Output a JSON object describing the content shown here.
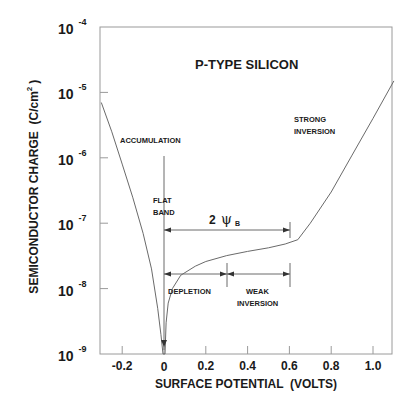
{
  "chart_data": {
    "type": "line",
    "title": "P-TYPE SILICON",
    "xlabel": "SURFACE POTENTIAL  (VOLTS)",
    "ylabel": "SEMICONDUCTOR CHARGE  (C/cm²)",
    "ylabel_text": "SEMICONDUCTOR CHARGE  (C/cm",
    "ylabel_sup": "2",
    "ylabel_close": ")",
    "xlim": [
      -0.3,
      1.1
    ],
    "ylim": [
      1e-09,
      0.0001
    ],
    "yscale": "log",
    "grid": false,
    "x_ticks": [
      {
        "value": -0.2,
        "label": "-0.2"
      },
      {
        "value": 0,
        "label": "0"
      },
      {
        "value": 0.2,
        "label": "0.2"
      },
      {
        "value": 0.4,
        "label": "0.4"
      },
      {
        "value": 0.6,
        "label": "0.6"
      },
      {
        "value": 0.8,
        "label": "0.8"
      },
      {
        "value": 1.0,
        "label": "1.0"
      }
    ],
    "y_ticks": [
      {
        "exp": -4,
        "base": "10",
        "sup": "-4"
      },
      {
        "exp": -5,
        "base": "10",
        "sup": "-5"
      },
      {
        "exp": -6,
        "base": "10",
        "sup": "-6"
      },
      {
        "exp": -7,
        "base": "10",
        "sup": "-7"
      },
      {
        "exp": -8,
        "base": "10",
        "sup": "-8"
      },
      {
        "exp": -9,
        "base": "10",
        "sup": "-9"
      }
    ],
    "series": [
      {
        "name": "|Qs| vs surface potential",
        "points": [
          [
            -0.3,
            7e-06
          ],
          [
            -0.25,
            2.5e-06
          ],
          [
            -0.2,
            8e-07
          ],
          [
            -0.15,
            2.5e-07
          ],
          [
            -0.1,
            7e-08
          ],
          [
            -0.06,
            2e-08
          ],
          [
            -0.03,
            5e-09
          ],
          [
            -0.015,
            2e-09
          ],
          [
            -0.005,
            1e-09
          ],
          [
            0.005,
            1e-09
          ],
          [
            0.01,
            3e-09
          ],
          [
            0.02,
            6e-09
          ],
          [
            0.04,
            1e-08
          ],
          [
            0.08,
            1.6e-08
          ],
          [
            0.15,
            2.2e-08
          ],
          [
            0.2,
            2.6e-08
          ],
          [
            0.3,
            3.2e-08
          ],
          [
            0.4,
            3.7e-08
          ],
          [
            0.5,
            4.2e-08
          ],
          [
            0.58,
            4.8e-08
          ],
          [
            0.64,
            5.6e-08
          ],
          [
            0.7,
            1e-07
          ],
          [
            0.8,
            3e-07
          ],
          [
            0.9,
            1.1e-06
          ],
          [
            1.0,
            4e-06
          ],
          [
            1.1,
            1.5e-05
          ]
        ]
      }
    ],
    "annotations": [
      {
        "id": "accumulation",
        "text": "ACCUMULATION"
      },
      {
        "id": "flat_band_1",
        "text": "FLAT"
      },
      {
        "id": "flat_band_2",
        "text": "BAND"
      },
      {
        "id": "two_psi_b_num",
        "text": "2"
      },
      {
        "id": "two_psi_b_sym",
        "text": "ψ"
      },
      {
        "id": "two_psi_b_sub",
        "text": "B"
      },
      {
        "id": "depletion",
        "text": "DEPLETION"
      },
      {
        "id": "weak_inversion_1",
        "text": "WEAK"
      },
      {
        "id": "weak_inversion_2",
        "text": "INVERSION"
      },
      {
        "id": "strong_inversion_1",
        "text": "STRONG"
      },
      {
        "id": "strong_inversion_2",
        "text": "INVERSION"
      }
    ],
    "ranges": [
      {
        "name": "2psiB",
        "from": 0,
        "to": 0.6,
        "y": 1e-07
      },
      {
        "name": "depletion",
        "from": 0,
        "to": 0.3,
        "y": 1.3e-08
      },
      {
        "name": "weak_inversion",
        "from": 0.3,
        "to": 0.6,
        "y": 1.3e-08
      }
    ]
  }
}
